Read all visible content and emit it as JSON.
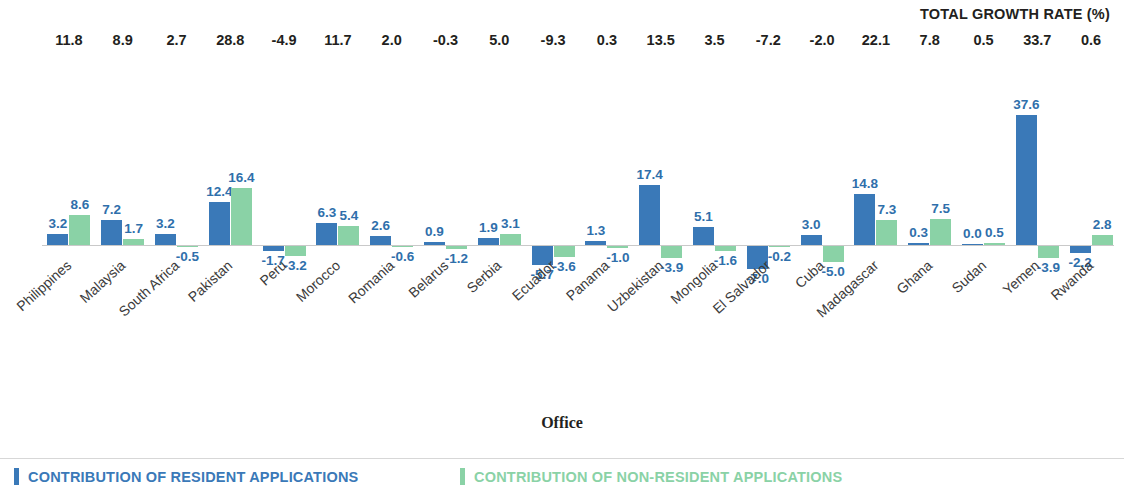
{
  "header": {
    "total_growth_title": "TOTAL GROWTH RATE (%)"
  },
  "axes": {
    "y_title": "Contribution to growth",
    "x_title": "Office"
  },
  "legend": {
    "resident_label": "CONTRIBUTION OF RESIDENT APPLICATIONS",
    "nonresident_label": "CONTRIBUTION OF NON-RESIDENT APPLICATIONS",
    "resident_color": "#3a79b8",
    "nonresident_color": "#8ad2a6"
  },
  "chart_data": {
    "type": "bar",
    "title": "",
    "subtitle": "",
    "xlabel": "Office",
    "ylabel": "Contribution to growth",
    "grid": false,
    "legend_position": "bottom",
    "ylim": [
      -8,
      38
    ],
    "categories": [
      "Philippines",
      "Malaysia",
      "South Africa",
      "Pakistan",
      "Peru",
      "Morocco",
      "Romania",
      "Belarus",
      "Serbia",
      "Ecuador",
      "Panama",
      "Uzbekistan",
      "Mongolia",
      "El Salvador",
      "Cuba",
      "Madagascar",
      "Ghana",
      "Sudan",
      "Yemen",
      "Rwanda"
    ],
    "series": [
      {
        "name": "CONTRIBUTION OF RESIDENT APPLICATIONS",
        "color": "#3a79b8",
        "values": [
          3.2,
          7.2,
          3.2,
          12.4,
          -1.7,
          6.3,
          2.6,
          0.9,
          1.9,
          -5.7,
          1.3,
          17.4,
          5.1,
          -7.0,
          3.0,
          14.8,
          0.3,
          0.0,
          37.6,
          -2.2
        ],
        "labels": [
          "3.2",
          "7.2",
          "3.2",
          "12.4",
          "-1.7",
          "6.3",
          "2.6",
          "0.9",
          "1.9",
          "-5.7",
          "1.3",
          "17.4",
          "5.1",
          "-7.0",
          "3.0",
          "14.8",
          "0.3",
          "0.0",
          "37.6",
          "-2.2"
        ]
      },
      {
        "name": "CONTRIBUTION OF NON-RESIDENT APPLICATIONS",
        "color": "#8ad2a6",
        "values": [
          8.6,
          1.7,
          -0.5,
          16.4,
          -3.2,
          5.4,
          -0.6,
          -1.2,
          3.1,
          -3.6,
          -1.0,
          -3.9,
          -1.6,
          -0.2,
          -5.0,
          7.3,
          7.5,
          0.5,
          -3.9,
          2.8
        ],
        "labels": [
          "8.6",
          "1.7",
          "-0.5",
          "16.4",
          "-3.2",
          "5.4",
          "-0.6",
          "-1.2",
          "3.1",
          "-3.6",
          "-1.0",
          "-3.9",
          "-1.6",
          "-0.2",
          "-5.0",
          "7.3",
          "7.5",
          "0.5",
          "-3.9",
          "2.8"
        ]
      }
    ],
    "total_growth_rate": {
      "label": "TOTAL GROWTH RATE (%)",
      "values": [
        11.8,
        8.9,
        2.7,
        28.8,
        -4.9,
        11.7,
        2.0,
        -0.3,
        5.0,
        -9.3,
        0.3,
        13.5,
        3.5,
        -7.2,
        -2.0,
        22.1,
        7.8,
        0.5,
        33.7,
        0.6
      ],
      "labels": [
        "11.8",
        "8.9",
        "2.7",
        "28.8",
        "-4.9",
        "11.7",
        "2.0",
        "-0.3",
        "5.0",
        "-9.3",
        "0.3",
        "13.5",
        "3.5",
        "-7.2",
        "-2.0",
        "22.1",
        "7.8",
        "0.5",
        "33.7",
        "0.6"
      ]
    }
  }
}
